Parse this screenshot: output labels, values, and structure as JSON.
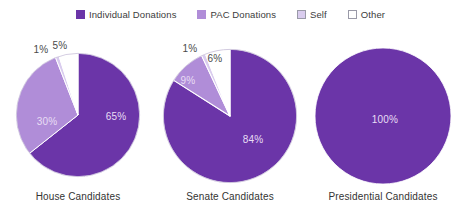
{
  "legend": {
    "items": [
      {
        "label": "Individual Donations",
        "color": "#6B35A8",
        "outlined": false,
        "icon": "legend-swatch"
      },
      {
        "label": "PAC Donations",
        "color": "#B08DD8",
        "outlined": false,
        "icon": "legend-swatch"
      },
      {
        "label": "Self",
        "color": "#D9CCEE",
        "outlined": true,
        "icon": "legend-swatch"
      },
      {
        "label": "Other",
        "color": "#FFFFFF",
        "outlined": true,
        "icon": "legend-swatch"
      }
    ]
  },
  "chart_data": {
    "type": "pie",
    "title": "",
    "legend_position": "top-center",
    "categories": [
      "Individual Donations",
      "PAC Donations",
      "Self",
      "Other"
    ],
    "colors": {
      "Individual Donations": "#6B35A8",
      "PAC Donations": "#B08DD8",
      "Self": "#D9CCEE",
      "Other": "#FFFFFF"
    },
    "units": "percent",
    "charts": [
      {
        "label": "House Candidates",
        "values": [
          65,
          30,
          1,
          5
        ],
        "data_labels": [
          "65%",
          "30%",
          "1%",
          "5%"
        ]
      },
      {
        "label": "Senate Candidates",
        "values": [
          84,
          9,
          1,
          6
        ],
        "data_labels": [
          "84%",
          "9%",
          "1%",
          "6%"
        ]
      },
      {
        "label": "Presidential Candidates",
        "values": [
          100,
          0,
          0,
          0
        ],
        "data_labels": [
          "100%"
        ]
      }
    ]
  },
  "pies": [
    {
      "caption": "House Candidates",
      "labels": [
        {
          "text": "65%",
          "x": 116,
          "y": 116,
          "placement": "inside"
        },
        {
          "text": "30%",
          "x": 47,
          "y": 121,
          "placement": "inside"
        },
        {
          "text": "1%",
          "x": 41,
          "y": 49,
          "placement": "outside"
        },
        {
          "text": "5%",
          "x": 60,
          "y": 45,
          "placement": "outside"
        }
      ]
    },
    {
      "caption": "Senate Candidates",
      "labels": [
        {
          "text": "84%",
          "x": 253,
          "y": 139,
          "placement": "inside"
        },
        {
          "text": "9%",
          "x": 188,
          "y": 80,
          "placement": "inside"
        },
        {
          "text": "1%",
          "x": 190,
          "y": 48,
          "placement": "outside"
        },
        {
          "text": "6%",
          "x": 215,
          "y": 58,
          "placement": "outside"
        }
      ]
    },
    {
      "caption": "Presidential Candidates",
      "labels": [
        {
          "text": "100%",
          "x": 385,
          "y": 119,
          "placement": "inside"
        }
      ]
    }
  ]
}
